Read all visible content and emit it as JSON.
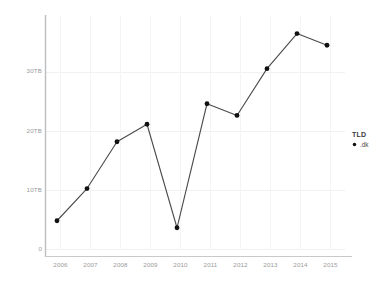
{
  "chart_data": {
    "type": "line",
    "title": "",
    "xlabel": "",
    "ylabel": "",
    "categories": [
      "2006",
      "2007",
      "2008",
      "2009",
      "2010",
      "2011",
      "2012",
      "2013",
      "2014",
      "2015"
    ],
    "x": [
      2006,
      2007,
      2008,
      2009,
      2010,
      2011,
      2012,
      2013,
      2014,
      2015
    ],
    "series": [
      {
        "name": ".dk",
        "values": [
          5.0,
          10.5,
          18.5,
          21.5,
          3.8,
          25.0,
          23.0,
          31.0,
          37.0,
          35.0
        ]
      }
    ],
    "xlim": [
      2005.6,
      2015.6
    ],
    "ylim": [
      0,
      40
    ],
    "yticks": [
      0,
      10,
      20,
      30
    ],
    "ytick_labels": [
      "0",
      "10TB",
      "20TB",
      "30TB"
    ],
    "xtick_labels": [
      "2006",
      "2007",
      "2008",
      "2009",
      "2010",
      "2011",
      "2012",
      "2013",
      "2014",
      "2015"
    ],
    "grid": true,
    "legend_position": "right",
    "marker": "circle",
    "line_color": "#444444",
    "marker_color": "#111111",
    "grid_color": "#f0f0f0",
    "axis_color": "#bcbcbc",
    "tick_label_color": "#9a9a9a"
  },
  "legend": {
    "title": "TLD",
    "entries": [
      {
        "label": ".dk",
        "marker": "circle-marker"
      }
    ]
  },
  "axes": {
    "y_ticks": [
      {
        "label": "30TB",
        "top": 67
      },
      {
        "label": "20TB",
        "top": 127
      },
      {
        "label": "10TB",
        "top": 186
      },
      {
        "label": "0",
        "top": 245
      }
    ],
    "x_ticks": [
      {
        "label": "2006",
        "left": 47
      },
      {
        "label": "2007",
        "left": 77
      },
      {
        "label": "2008",
        "left": 107
      },
      {
        "label": "2009",
        "left": 137
      },
      {
        "label": "2010",
        "left": 167
      },
      {
        "label": "2011",
        "left": 197
      },
      {
        "label": "2012",
        "left": 227
      },
      {
        "label": "2013",
        "left": 257
      },
      {
        "label": "2014",
        "left": 287
      },
      {
        "label": "2015",
        "left": 317
      }
    ]
  }
}
